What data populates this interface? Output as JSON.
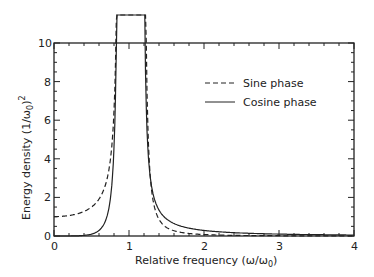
{
  "chart_data": {
    "type": "line",
    "title": "",
    "xlabel": "Relative frequency (ω/ω0)",
    "ylabel": "Energy density (1/ω0)^2",
    "xlim": [
      0,
      4
    ],
    "ylim": [
      0,
      10
    ],
    "xticks": [
      "0",
      "1",
      "2",
      "3",
      "4"
    ],
    "yticks": [
      "0",
      "2",
      "4",
      "6",
      "8",
      "10"
    ],
    "legend": {
      "position": "upper right",
      "entries": [
        "Sine phase",
        "Cosine phase"
      ]
    },
    "series": [
      {
        "name": "Sine phase",
        "style": "dashed",
        "x": [
          0,
          0.2,
          0.4,
          0.6,
          0.75,
          0.85,
          0.9,
          1.2,
          1.3,
          1.5,
          2,
          3,
          4
        ],
        "y": [
          1,
          1.1,
          1.4,
          2.2,
          4,
          10,
          14,
          14,
          6,
          1.5,
          0.3,
          0.05,
          0.02
        ]
      },
      {
        "name": "Cosine phase",
        "style": "solid",
        "x": [
          0,
          0.2,
          0.4,
          0.6,
          0.75,
          0.85,
          0.88,
          1.2,
          1.3,
          1.5,
          2,
          3,
          4
        ],
        "y": [
          0,
          0.05,
          0.3,
          1.2,
          3,
          8,
          14,
          14,
          8,
          3,
          0.9,
          0.2,
          0.05
        ]
      }
    ]
  },
  "labels": {
    "xlabel": "Relative frequency",
    "xunit": "(ω/ω",
    "ylabel": "Energy density",
    "yunit": "(1/ω",
    "legend_sine": "Sine phase",
    "legend_cos": "Cosine phase"
  }
}
